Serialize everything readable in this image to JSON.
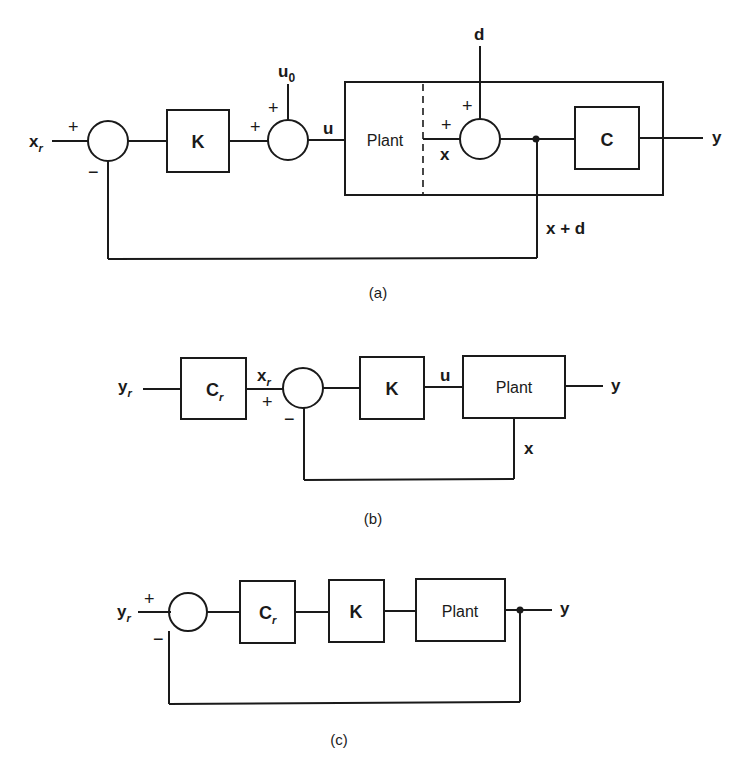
{
  "diagram_a": {
    "caption": "(a)",
    "input": {
      "label": "x",
      "sub": "r"
    },
    "sum1": {
      "plus": "+",
      "minus": "−"
    },
    "gain_block": "K",
    "sum2": {
      "plus_left": "+",
      "plus_top": "+"
    },
    "u0": {
      "label": "u",
      "sub": "0"
    },
    "u_label": "u",
    "plant_block": "Plant",
    "x_label": "x",
    "sum3": {
      "plus_left": "+",
      "plus_top": "+"
    },
    "disturbance": "d",
    "output_block": "C",
    "output": "y",
    "feedback_label": "x + d"
  },
  "diagram_b": {
    "caption": "(b)",
    "input": {
      "label": "y",
      "sub": "r"
    },
    "prefilter_block": {
      "label": "C",
      "sub": "r"
    },
    "xr": {
      "label": "x",
      "sub": "r"
    },
    "sum": {
      "plus": "+",
      "minus": "−"
    },
    "gain_block": "K",
    "u_label": "u",
    "plant_block": "Plant",
    "output": "y",
    "feedback_label": "x"
  },
  "diagram_c": {
    "caption": "(c)",
    "input": {
      "label": "y",
      "sub": "r"
    },
    "sum": {
      "plus": "+",
      "minus": "−"
    },
    "prefilter_block": {
      "label": "C",
      "sub": "r"
    },
    "gain_block": "K",
    "plant_block": "Plant",
    "output": "y"
  }
}
